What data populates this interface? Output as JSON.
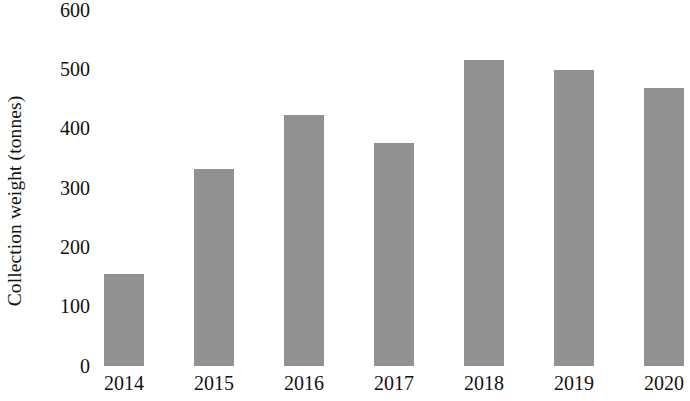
{
  "chart_data": {
    "type": "bar",
    "title": "",
    "subtitle": "",
    "xlabel": "",
    "ylabel": "Collection weight (tonnes)",
    "categories": [
      "2014",
      "2015",
      "2016",
      "2017",
      "2018",
      "2019",
      "2020"
    ],
    "values": [
      155,
      332,
      422,
      375,
      515,
      498,
      468
    ],
    "series": [
      {
        "name": "Collection weight",
        "values": [
          155,
          332,
          422,
          375,
          515,
          498,
          468
        ]
      }
    ],
    "ylim": [
      0,
      600
    ],
    "ytick_labels": [
      "600",
      "500",
      "400",
      "300",
      "200",
      "100",
      "0"
    ],
    "ytick_values": [
      600,
      500,
      400,
      300,
      200,
      100,
      0
    ],
    "grid": false,
    "legend": "none",
    "bar_color": "#919191",
    "background_color": "#ffffff",
    "text_color": "#111111"
  },
  "axes": {
    "y_title": "Collection weight (tonnes)"
  }
}
